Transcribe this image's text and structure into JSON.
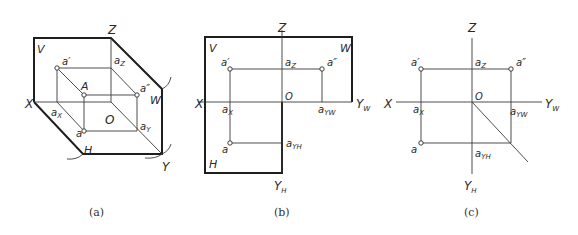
{
  "figure": {
    "panels": [
      {
        "id": "a",
        "caption": "(a)",
        "kind": "axonometric",
        "labels": {
          "Z": "Z",
          "V": "V",
          "W": "W",
          "X": "X",
          "H": "H",
          "Y": "Y",
          "O": "O",
          "a_prime": "a′",
          "a_z": "a",
          "a_z_sub": "Z",
          "A": "A",
          "a_dprime": "a″",
          "a_x": "a",
          "a_x_sub": "X",
          "a": "a",
          "a_y": "a",
          "a_y_sub": "Y"
        }
      },
      {
        "id": "b",
        "caption": "(b)",
        "kind": "unfolded-planes",
        "labels": {
          "Z": "Z",
          "V": "V",
          "W": "W",
          "X": "X",
          "H": "H",
          "O": "O",
          "Y_W": "Y",
          "Y_W_sub": "W",
          "Y_H": "Y",
          "Y_H_sub": "H",
          "a_prime": "a′",
          "a_z": "a",
          "a_z_sub": "Z",
          "a_dprime": "a″",
          "a_x": "a",
          "a_x_sub": "X",
          "a_yw": "a",
          "a_yw_sub": "YW",
          "a": "a",
          "a_yh": "a",
          "a_yh_sub": "YH"
        }
      },
      {
        "id": "c",
        "caption": "(c)",
        "kind": "projection-drawing",
        "labels": {
          "Z": "Z",
          "X": "X",
          "O": "O",
          "Y_W": "Y",
          "Y_W_sub": "W",
          "Y_H": "Y",
          "Y_H_sub": "H",
          "a_prime": "a′",
          "a_z": "a",
          "a_z_sub": "Z",
          "a_dprime": "a″",
          "a_x": "a",
          "a_x_sub": "X",
          "a_yw": "a",
          "a_yw_sub": "YW",
          "a": "a",
          "a_yh": "a",
          "a_yh_sub": "YH"
        }
      }
    ]
  }
}
